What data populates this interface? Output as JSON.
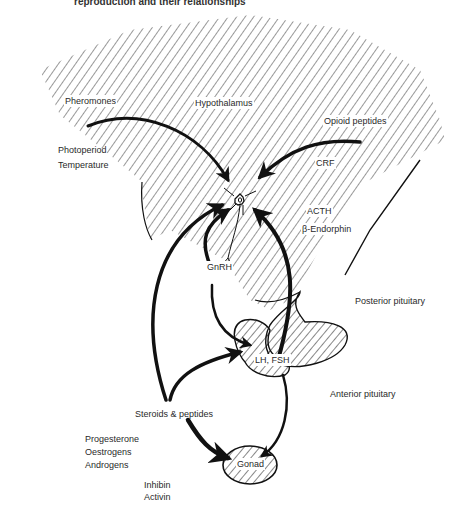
{
  "caption": "reproduction and their relationships",
  "regions": {
    "hypothalamus": "Hypothalamus",
    "posterior_pituitary": "Posterior pituitary",
    "anterior_pituitary": "Anterior pituitary",
    "gonad": "Gonad"
  },
  "inputs": {
    "pheromones": "Pheromones",
    "opioid_peptides": "Opioid peptides",
    "photoperiod": "Photoperiod",
    "temperature": "Temperature",
    "crf": "CRF",
    "acth": "ACTH",
    "beta_endorphin": "β-Endorphin"
  },
  "hormones": {
    "gnrh": "GnRH",
    "lh_fsh": "LH, FSH",
    "steroids_peptides": "Steroids & peptides",
    "progesterone": "Progesterone",
    "oestrogens": "Oestrogens",
    "androgens": "Androgens",
    "inhibin": "Inhibin",
    "activin": "Activin"
  },
  "colors": {
    "ink": "#111111",
    "hatch": "#333333",
    "text": "#2a2a2a",
    "background": "#ffffff"
  }
}
